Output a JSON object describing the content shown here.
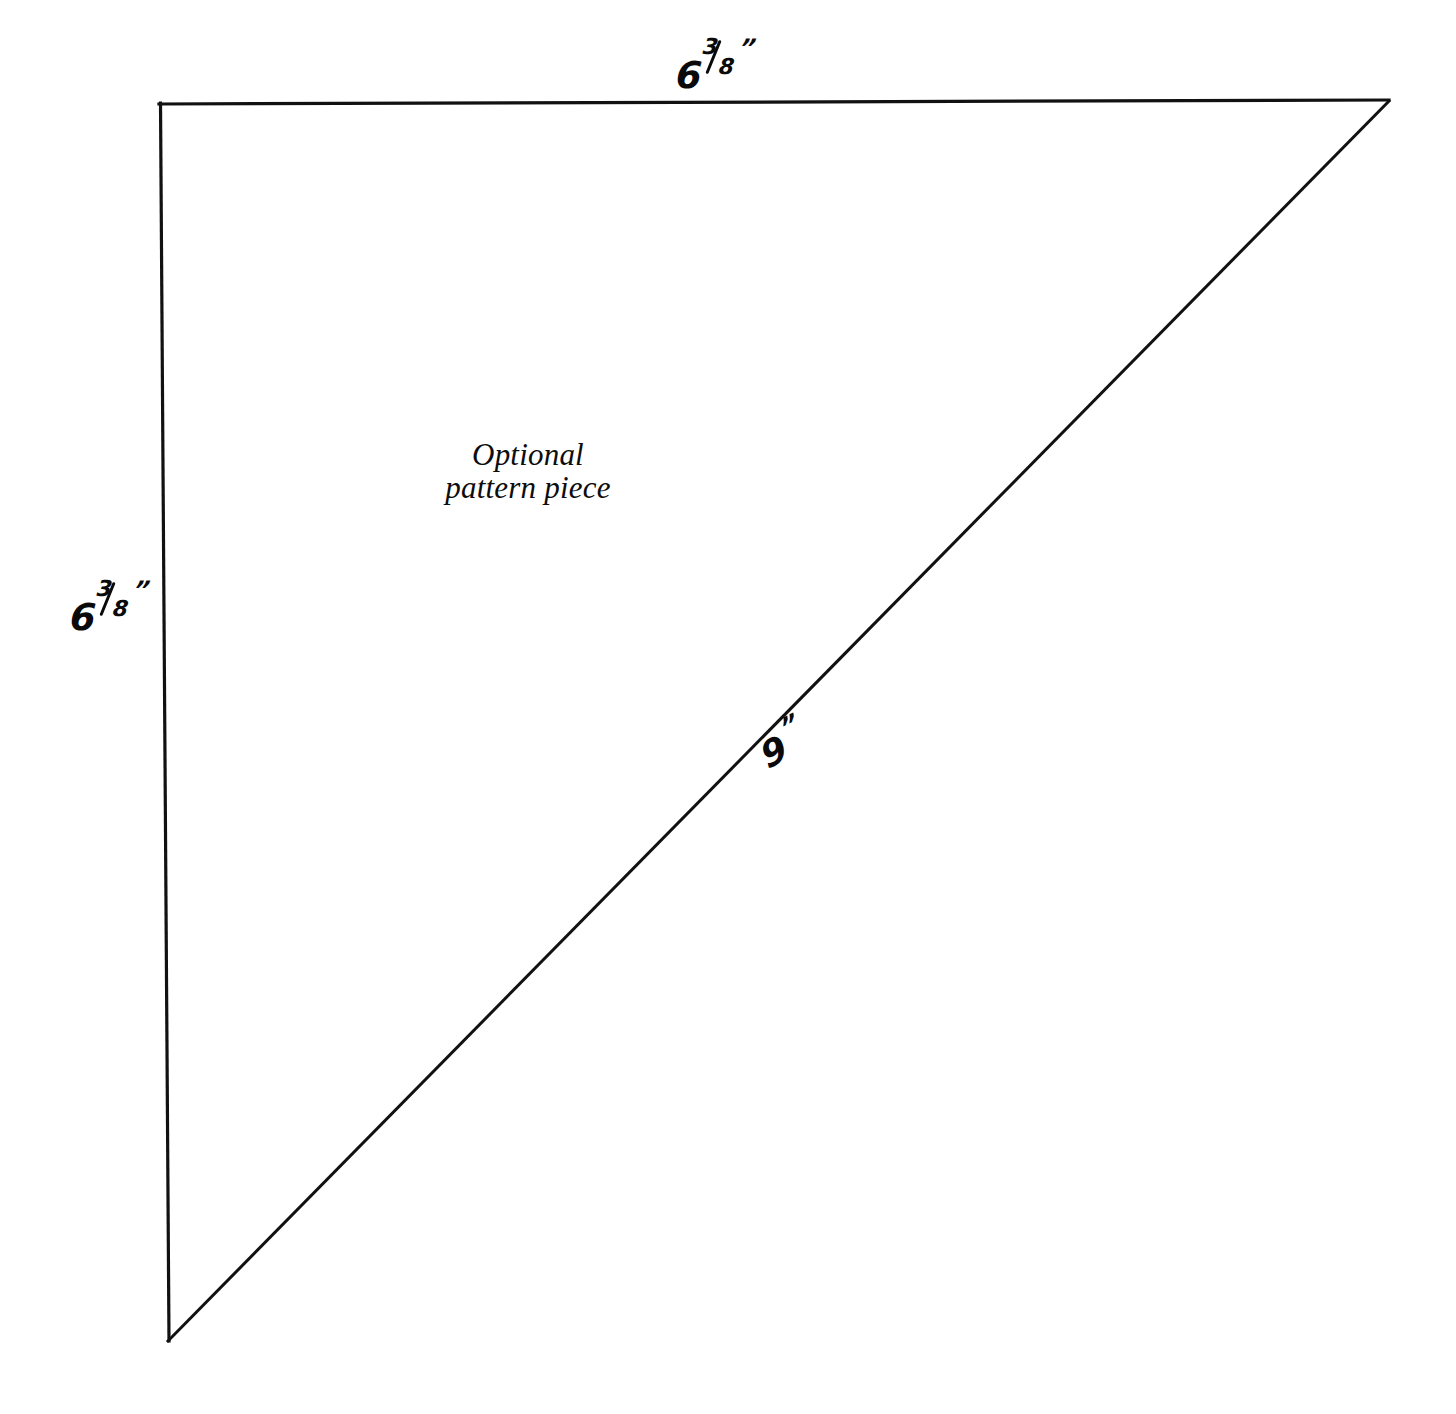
{
  "page": {
    "background_color": "#ffffff",
    "ink_color": "#0a0a0a",
    "width": 1456,
    "height": 1414
  },
  "caption": {
    "line1": "Optional",
    "line2": "pattern piece"
  },
  "labels": {
    "top": {
      "name": "top-edge-dimension",
      "whole": "6",
      "numerator": "3",
      "denominator": "8",
      "unit": "”",
      "full_text": "6 3/8\""
    },
    "left": {
      "name": "left-edge-dimension",
      "whole": "6",
      "numerator": "3",
      "denominator": "8",
      "unit": "”",
      "full_text": "6 3/8\""
    },
    "hypotenuse": {
      "name": "hypotenuse-dimension",
      "whole": "9",
      "unit": "”",
      "full_text": "9\""
    }
  },
  "shape": {
    "type": "right-triangle",
    "stroke_color": "#111111",
    "stroke_width": 3,
    "vertices": {
      "top_left": [
        159,
        104
      ],
      "top_right": [
        1389,
        100
      ],
      "bottom_left": [
        168,
        1340
      ]
    },
    "edges": [
      {
        "name": "top-edge",
        "from": "top_left",
        "to": "top_right",
        "length_label": "6 3/8\""
      },
      {
        "name": "left-edge",
        "from": "top_left",
        "to": "bottom_left",
        "length_label": "6 3/8\""
      },
      {
        "name": "hypotenuse-edge",
        "from": "bottom_left",
        "to": "top_right",
        "length_label": "9\""
      }
    ]
  }
}
